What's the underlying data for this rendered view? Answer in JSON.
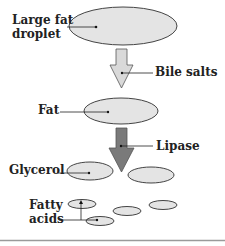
{
  "diagram": {
    "title": "",
    "colors": {
      "ellipse_fill": "#e4e4e4",
      "ellipse_stroke": "#444444",
      "bile_arrow_fill": "#d9d9d9",
      "lipase_arrow_fill": "#7a7a7a",
      "line": "#222222",
      "bottom_rule": "#9a9a9a"
    },
    "labels": {
      "large_fat_droplet_line1": "Large fat",
      "large_fat_droplet_line2": "droplet",
      "bile_salts": "Bile salts",
      "fat": "Fat",
      "lipase": "Lipase",
      "glycerol": "Glycerol",
      "fatty_acids_line1": "Fatty",
      "fatty_acids_line2": "acids"
    },
    "nodes": [
      {
        "id": "large-fat-droplet",
        "label": "Large fat droplet"
      },
      {
        "id": "fat",
        "label": "Fat"
      },
      {
        "id": "glycerol",
        "label": "Glycerol"
      },
      {
        "id": "fatty-acids",
        "label": "Fatty acids"
      }
    ],
    "edges": [
      {
        "from": "large-fat-droplet",
        "to": "fat",
        "label": "Bile salts"
      },
      {
        "from": "fat",
        "to": "glycerol",
        "label": "Lipase"
      }
    ]
  }
}
